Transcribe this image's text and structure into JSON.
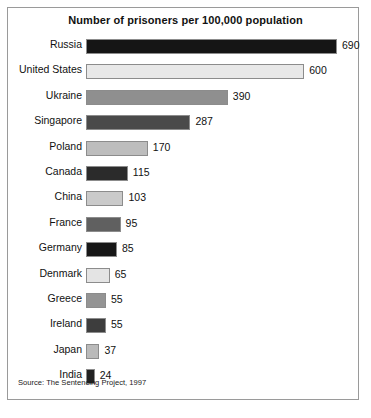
{
  "chart_data": {
    "type": "bar",
    "orientation": "horizontal",
    "title": "Number of prisoners per 100,000 population",
    "xlabel": "",
    "ylabel": "",
    "xlim": [
      0,
      690
    ],
    "grid": false,
    "legend": null,
    "source_note": "Source: The Sentencing Project, 1997",
    "categories": [
      "Russia",
      "United States",
      "Ukraine",
      "Singapore",
      "Poland",
      "Canada",
      "China",
      "France",
      "Germany",
      "Denmark",
      "Greece",
      "Ireland",
      "Japan",
      "India"
    ],
    "values": [
      690,
      600,
      390,
      287,
      170,
      115,
      103,
      95,
      85,
      65,
      55,
      55,
      37,
      24
    ],
    "value_labels": [
      "690",
      "600",
      "390",
      "287",
      "170",
      "115",
      "103",
      "95",
      "85",
      "65",
      "55",
      "55",
      "37",
      "24"
    ],
    "bar_colors": [
      "#151515",
      "#e8e8e8",
      "#8f8f8f",
      "#4a4a4a",
      "#bdbdbd",
      "#2b2b2b",
      "#cacaca",
      "#606060",
      "#171717",
      "#e4e4e4",
      "#949494",
      "#3d3d3d",
      "#bababa",
      "#222222"
    ],
    "bars": [
      {
        "category": "Russia",
        "value": 690,
        "label": "690",
        "color": "#151515"
      },
      {
        "category": "United States",
        "value": 600,
        "label": "600",
        "color": "#e8e8e8"
      },
      {
        "category": "Ukraine",
        "value": 390,
        "label": "390",
        "color": "#8f8f8f"
      },
      {
        "category": "Singapore",
        "value": 287,
        "label": "287",
        "color": "#4a4a4a"
      },
      {
        "category": "Poland",
        "value": 170,
        "label": "170",
        "color": "#bdbdbd"
      },
      {
        "category": "Canada",
        "value": 115,
        "label": "115",
        "color": "#2b2b2b"
      },
      {
        "category": "China",
        "value": 103,
        "label": "103",
        "color": "#cacaca"
      },
      {
        "category": "France",
        "value": 95,
        "label": "95",
        "color": "#606060"
      },
      {
        "category": "Germany",
        "value": 85,
        "label": "85",
        "color": "#171717"
      },
      {
        "category": "Denmark",
        "value": 65,
        "label": "65",
        "color": "#e4e4e4"
      },
      {
        "category": "Greece",
        "value": 55,
        "label": "55",
        "color": "#949494"
      },
      {
        "category": "Ireland",
        "value": 55,
        "label": "55",
        "color": "#3d3d3d"
      },
      {
        "category": "Japan",
        "value": 37,
        "label": "37",
        "color": "#bababa"
      },
      {
        "category": "India",
        "value": 24,
        "label": "24",
        "color": "#222222"
      }
    ]
  },
  "figure": {
    "frame_color": "#9a9a9a",
    "background": "#ffffff",
    "text_color": "#111111"
  }
}
